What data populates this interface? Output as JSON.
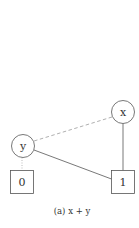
{
  "diagram": {
    "type": "binary-decision-diagram",
    "caption": "(a) x + y",
    "nodes": [
      {
        "id": "x",
        "label": "x",
        "shape": "circle",
        "cx": 123,
        "cy": 112,
        "r": 11.5
      },
      {
        "id": "y",
        "label": "y",
        "shape": "circle",
        "cx": 23,
        "cy": 146,
        "r": 11.5
      }
    ],
    "terminals": [
      {
        "id": "t0",
        "label": "0",
        "shape": "square",
        "x": 10.5,
        "y": 170.5,
        "w": 23,
        "h": 23
      },
      {
        "id": "t1",
        "label": "1",
        "shape": "square",
        "x": 111.5,
        "y": 170.5,
        "w": 23,
        "h": 23
      }
    ],
    "edges": [
      {
        "from": "x",
        "to": "y",
        "style": "dashed",
        "meaning": "low"
      },
      {
        "from": "x",
        "to": "t1",
        "style": "solid",
        "meaning": "high"
      },
      {
        "from": "y",
        "to": "t0",
        "style": "dotted",
        "meaning": "low"
      },
      {
        "from": "y",
        "to": "t1",
        "style": "solid",
        "meaning": "high"
      }
    ],
    "colors": {
      "stroke": "#555555",
      "dashed": "#aaaaaa",
      "text": "#333333",
      "background": "#ffffff"
    }
  }
}
